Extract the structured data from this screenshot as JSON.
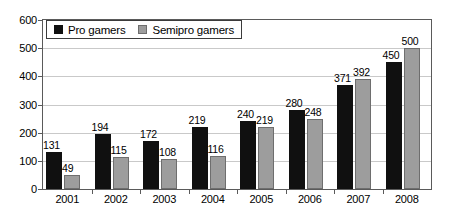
{
  "chart_data": {
    "type": "bar",
    "title": "",
    "xlabel": "",
    "ylabel": "",
    "categories": [
      "2001",
      "2002",
      "2003",
      "2004",
      "2005",
      "2006",
      "2007",
      "2008"
    ],
    "series": [
      {
        "name": "Pro gamers",
        "color": "#101010",
        "values": [
          131,
          194,
          172,
          219,
          240,
          280,
          371,
          450
        ]
      },
      {
        "name": "Semipro gamers",
        "color": "#9d9d9d",
        "values": [
          49,
          115,
          108,
          116,
          219,
          248,
          392,
          500
        ]
      }
    ],
    "ylim": [
      0,
      600
    ],
    "ytick_step": 100,
    "yticks": [
      "0",
      "100",
      "200",
      "300",
      "400",
      "500",
      "600"
    ],
    "grid": true,
    "legend_position": "top-left-inside",
    "show_value_labels": true
  },
  "legend": {
    "entries": [
      {
        "label": "Pro gamers",
        "swatch": "pro"
      },
      {
        "label": "Semipro gamers",
        "swatch": "semipro"
      }
    ]
  },
  "colors": {
    "pro": "#101010",
    "semipro": "#9d9d9d",
    "gridline": "#c9c9c9",
    "axis": "#5a5a5a",
    "background": "#ffffff",
    "text": "#000000"
  }
}
